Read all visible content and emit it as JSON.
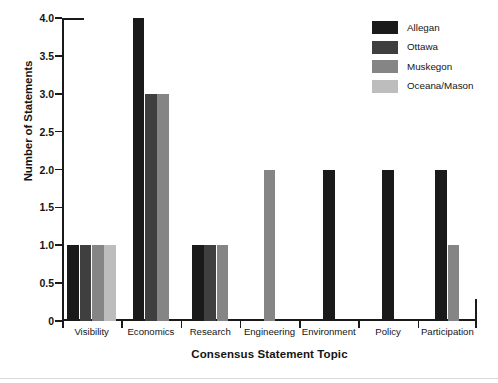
{
  "chart_data": {
    "type": "bar",
    "title": "",
    "xlabel": "Consensus Statement Topic",
    "ylabel": "Number of Statements",
    "categories": [
      "Visibility",
      "Economics",
      "Research",
      "Engineering",
      "Environment",
      "Policy",
      "Participation"
    ],
    "ylim": [
      0,
      4.0
    ],
    "ytick_labels": [
      "0",
      "0.5",
      "1.0",
      "1.5",
      "2.0",
      "2.5",
      "3.0",
      "3.5",
      "4.0"
    ],
    "ytick_values": [
      0,
      0.5,
      1.0,
      1.5,
      2.0,
      2.5,
      3.0,
      3.5,
      4.0
    ],
    "grid": false,
    "legend_position": "upper-right-outside",
    "series": [
      {
        "name": "Allegan",
        "color": "#1a1a1a",
        "values": [
          1,
          4,
          1,
          0,
          2,
          2,
          2
        ]
      },
      {
        "name": "Ottawa",
        "color": "#3f3f3f",
        "values": [
          1,
          3,
          1,
          0,
          0,
          0,
          0
        ]
      },
      {
        "name": "Muskegon",
        "color": "#858585",
        "values": [
          1,
          3,
          1,
          2,
          0,
          0,
          1
        ]
      },
      {
        "name": "Oceana/Mason",
        "color": "#bdbdbd",
        "values": [
          1,
          0,
          0,
          0,
          0,
          0,
          0
        ]
      }
    ]
  },
  "legend": {
    "entries": [
      {
        "label": "Allegan",
        "color": "#1a1a1a"
      },
      {
        "label": "Ottawa",
        "color": "#3f3f3f"
      },
      {
        "label": "Muskegon",
        "color": "#858585"
      },
      {
        "label": "Oceana/Mason",
        "color": "#bdbdbd"
      }
    ]
  },
  "axes": {
    "y_title": "Number of Statements",
    "x_title": "Consensus Statement Topic"
  }
}
